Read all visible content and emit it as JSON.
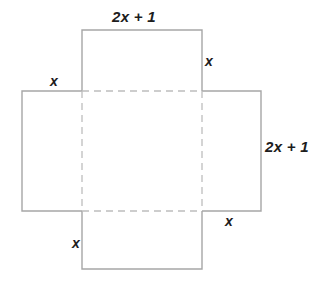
{
  "figure": {
    "type": "geometry-net-diagram",
    "colors": {
      "solid_edge": "#a6a6a6",
      "dashed_fold": "#bdbdbd",
      "label_text": "#1d1d1d",
      "background": "#ffffff"
    },
    "geometry": {
      "center_square": {
        "x": 82,
        "y": 91,
        "width": 120,
        "height": 120
      },
      "top_flap": {
        "x": 82,
        "y": 30,
        "width": 120,
        "height": 61
      },
      "left_flap": {
        "x": 22,
        "y": 91,
        "width": 60,
        "height": 120
      },
      "right_flap": {
        "x": 202,
        "y": 91,
        "width": 59,
        "height": 120
      },
      "bottom_flap": {
        "x": 82,
        "y": 211,
        "width": 120,
        "height": 58
      }
    },
    "labels": {
      "top_width": "2x + 1",
      "top_right_x": "x",
      "left_x": "x",
      "right_height": "2x + 1",
      "bottom_right_x": "x",
      "bottom_left_x": "x"
    }
  }
}
